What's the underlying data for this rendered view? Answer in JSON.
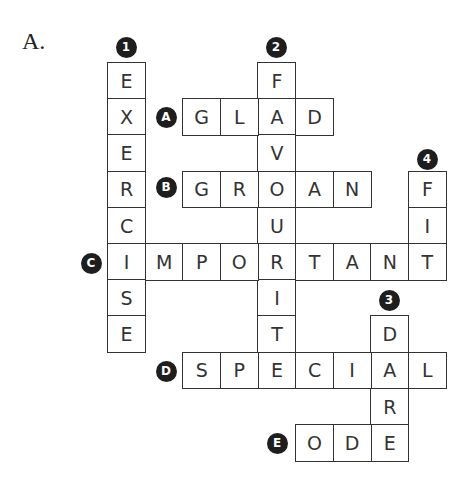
{
  "section_label": "A.",
  "grid": {
    "origin_x": 107,
    "origin_y": 62,
    "cell_w": 37.6,
    "cell_h": 36.2
  },
  "colors": {
    "border": "#333333",
    "badge_bg": "#1e1e1e",
    "badge_fg": "#ffffff",
    "text": "#333333"
  },
  "entries": [
    {
      "id": "1",
      "direction": "down",
      "answer": "EXERCISE",
      "row": 0,
      "col": 0,
      "badge": {
        "label": "1",
        "x": 126,
        "y": 47
      }
    },
    {
      "id": "2",
      "direction": "down",
      "answer": "FAVOURITE",
      "row": 0,
      "col": 4,
      "badge": {
        "label": "2",
        "x": 276,
        "y": 47
      }
    },
    {
      "id": "3",
      "direction": "down",
      "answer": "DARE",
      "row": 7,
      "col": 7,
      "badge": {
        "label": "3",
        "x": 389,
        "y": 300
      }
    },
    {
      "id": "4",
      "direction": "down",
      "answer": "FIT",
      "row": 3,
      "col": 8,
      "badge": {
        "label": "4",
        "x": 427,
        "y": 159
      }
    },
    {
      "id": "A",
      "direction": "across",
      "answer": "GLAD",
      "row": 1,
      "col": 2,
      "badge": {
        "label": "A",
        "x": 166,
        "y": 117
      }
    },
    {
      "id": "B",
      "direction": "across",
      "answer": "GROAN",
      "row": 3,
      "col": 2,
      "badge": {
        "label": "B",
        "x": 166,
        "y": 187
      }
    },
    {
      "id": "C",
      "direction": "across",
      "answer": "IMPORTANT",
      "row": 5,
      "col": 0,
      "badge": {
        "label": "C",
        "x": 91,
        "y": 263
      }
    },
    {
      "id": "D",
      "direction": "across",
      "answer": "SPECIAL",
      "row": 8,
      "col": 2,
      "badge": {
        "label": "D",
        "x": 166,
        "y": 371
      }
    },
    {
      "id": "E",
      "direction": "across",
      "answer": "ODE",
      "row": 10,
      "col": 5,
      "badge": {
        "label": "E",
        "x": 277,
        "y": 443
      }
    }
  ]
}
